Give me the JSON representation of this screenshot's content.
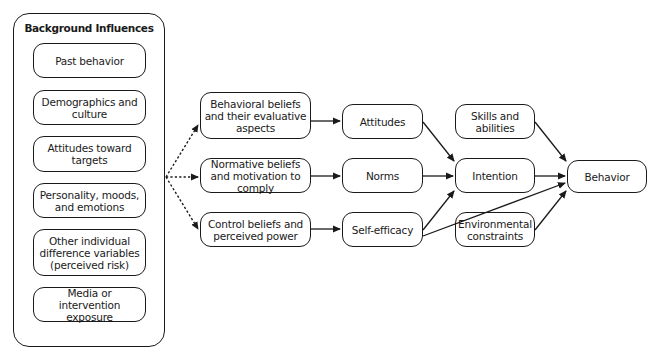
{
  "background_panel": {
    "title": "Background Influences",
    "items": [
      {
        "label": "Past behavior"
      },
      {
        "label": "Demographics and culture"
      },
      {
        "label": "Attitudes toward targets"
      },
      {
        "label": "Personality, moods, and emotions"
      },
      {
        "label": "Other individual difference variables (perceived risk)"
      },
      {
        "label": "Media or intervention exposure"
      }
    ]
  },
  "beliefs": [
    {
      "label": "Behavioral beliefs and their evaluative aspects"
    },
    {
      "label": "Normative beliefs and motivation to comply"
    },
    {
      "label": "Control beliefs and perceived power"
    }
  ],
  "constructs": [
    {
      "label": "Attitudes"
    },
    {
      "label": "Norms"
    },
    {
      "label": "Self-efficacy"
    }
  ],
  "moderators": {
    "skills": "Skills and abilities",
    "environment": "Environmental constraints"
  },
  "intention": "Intention",
  "behavior": "Behavior",
  "edges": [
    {
      "from": "Background Influences",
      "to": "Behavioral beliefs and their evaluative aspects",
      "style": "dotted"
    },
    {
      "from": "Background Influences",
      "to": "Normative beliefs and motivation to comply",
      "style": "dotted"
    },
    {
      "from": "Background Influences",
      "to": "Control beliefs and perceived power",
      "style": "dotted"
    },
    {
      "from": "Behavioral beliefs and their evaluative aspects",
      "to": "Attitudes",
      "style": "solid"
    },
    {
      "from": "Normative beliefs and motivation to comply",
      "to": "Norms",
      "style": "solid"
    },
    {
      "from": "Control beliefs and perceived power",
      "to": "Self-efficacy",
      "style": "solid"
    },
    {
      "from": "Attitudes",
      "to": "Intention",
      "style": "solid"
    },
    {
      "from": "Norms",
      "to": "Intention",
      "style": "solid"
    },
    {
      "from": "Self-efficacy",
      "to": "Intention",
      "style": "solid"
    },
    {
      "from": "Self-efficacy",
      "to": "Behavior",
      "style": "solid"
    },
    {
      "from": "Skills and abilities",
      "to": "Behavior",
      "style": "solid"
    },
    {
      "from": "Intention",
      "to": "Behavior",
      "style": "solid"
    },
    {
      "from": "Environmental constraints",
      "to": "Behavior",
      "style": "solid"
    }
  ]
}
